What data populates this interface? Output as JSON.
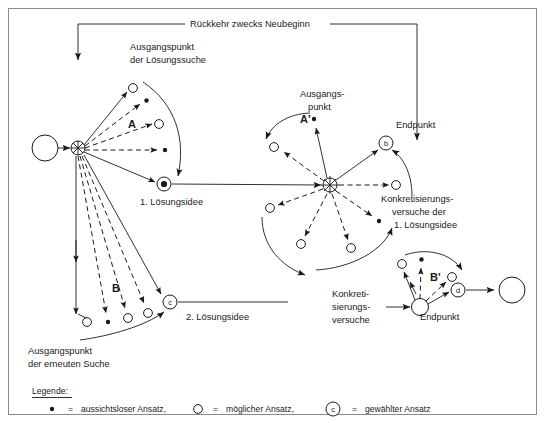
{
  "diagram": {
    "title_top": "Rückkehr zwecks Neubeginn",
    "labels": {
      "start_point_solution_search_l1": "Ausgangspunkt",
      "start_point_solution_search_l2": "der Lösungssuche",
      "fan_a": "A",
      "fan_a_prime": "A'",
      "fan_b": "B",
      "fan_b_prime": "B'",
      "idea_1": "1. Lösungsidee",
      "idea_2": "2. Lösungsidee",
      "start_point_mid_l1": "Ausgangs-",
      "start_point_mid_l2": "punkt",
      "endpoint_b": "Endpunkt",
      "endpoint_d": "Endpunkt",
      "concretization_1_l1": "Konkretisierungs-",
      "concretization_1_l2": "versuche der",
      "concretization_1_l3": "1. Lösungsidee",
      "concretization_2_l1": "Konkreti-",
      "concretization_2_l2": "sierungs-",
      "concretization_2_l3": "versuche",
      "restart_point_l1": "Ausgangspunkt",
      "restart_point_l2": "der erneuten Suche"
    },
    "nodes": {
      "a": "a",
      "b": "b",
      "c": "c",
      "d": "d"
    },
    "legend": {
      "title": "Legende:",
      "items": [
        {
          "icon": "filled-dot",
          "equals": "=",
          "text": "aussichtsloser Ansatz,"
        },
        {
          "icon": "open-circle",
          "equals": "=",
          "text": "möglicher Ansatz,"
        },
        {
          "icon": "circled-letter-c",
          "equals": "=",
          "text": "gewählter Ansatz",
          "letter": "c"
        }
      ]
    },
    "colors": {
      "ink": "#1a1a1a",
      "frame": "#8a8a8a",
      "background": "#ffffff"
    }
  }
}
